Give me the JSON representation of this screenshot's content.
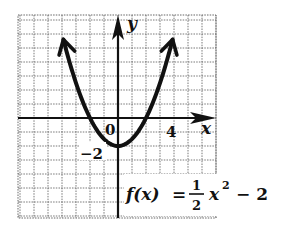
{
  "chart_data": {
    "type": "line",
    "title": "",
    "function": "f(x) = 1/2 x^2 - 2",
    "equation_label": {
      "lhs": "f(x)",
      "equals": "=",
      "numerator": "1",
      "denominator": "2",
      "var": "x",
      "exponent": "2",
      "rest": "− 2"
    },
    "xlabel": "x",
    "ylabel": "y",
    "tick_labels": {
      "origin": "0",
      "x_tick": "4",
      "y_tick": "−2"
    },
    "x_tick_value": 4,
    "y_tick_value": -2,
    "xlim": [
      -7,
      7
    ],
    "ylim": [
      -7,
      7
    ],
    "grid": true,
    "grid_unit": 1,
    "series": [
      {
        "name": "f(x) = 1/2 x^2 - 2",
        "x": [
          -3.9,
          -3,
          -2,
          -1,
          0,
          1,
          2,
          3,
          3.9
        ],
        "y": [
          5.6,
          2.5,
          0,
          -1.5,
          -2,
          -1.5,
          0,
          2.5,
          5.6
        ]
      }
    ],
    "vertex": [
      0,
      -2
    ],
    "x_intercepts": [
      -2,
      2
    ],
    "y_intercept": -2,
    "arrows_on_ends": true
  },
  "colors": {
    "ink": "#111111",
    "grid": "#555555",
    "background": "#ffffff"
  }
}
